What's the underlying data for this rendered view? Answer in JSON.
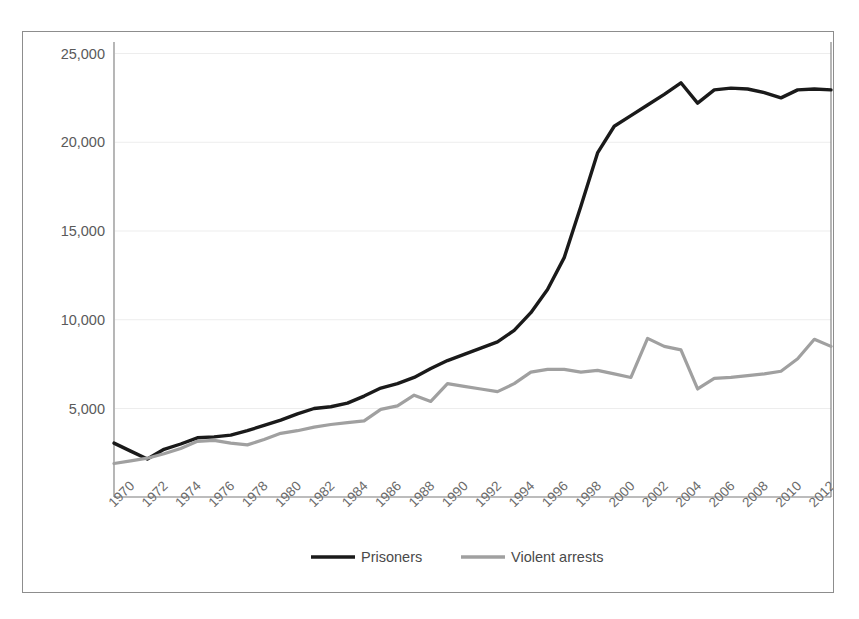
{
  "chart_data": {
    "type": "line",
    "title": "",
    "subtitle": "",
    "xlabel": "",
    "ylabel": "",
    "grid": true,
    "legend_position": "bottom",
    "xlim": [
      1970,
      2013
    ],
    "ylim": [
      0,
      25000
    ],
    "y_ticks": [
      5000,
      10000,
      15000,
      20000,
      25000
    ],
    "y_tick_labels": [
      "5,000",
      "10,000",
      "15,000",
      "20,000",
      "25,000"
    ],
    "x_tick_labels": [
      "1970",
      "1972",
      "1974",
      "1976",
      "1978",
      "1980",
      "1982",
      "1984",
      "1986",
      "1988",
      "1990",
      "1992",
      "1994",
      "1996",
      "1998",
      "2000",
      "2002",
      "2004",
      "2006",
      "2008",
      "2010",
      "2012"
    ],
    "x": [
      1970,
      1971,
      1972,
      1973,
      1974,
      1975,
      1976,
      1977,
      1978,
      1979,
      1980,
      1981,
      1982,
      1983,
      1984,
      1985,
      1986,
      1987,
      1988,
      1989,
      1990,
      1991,
      1992,
      1993,
      1994,
      1995,
      1996,
      1997,
      1998,
      1999,
      2000,
      2001,
      2002,
      2003,
      2004,
      2005,
      2006,
      2007,
      2008,
      2009,
      2010,
      2011,
      2012,
      2013
    ],
    "series": [
      {
        "name": "Prisoners",
        "color": "#1a1a1a",
        "values": [
          3050,
          2600,
          2150,
          2700,
          3000,
          3350,
          3400,
          3500,
          3750,
          4050,
          4350,
          4700,
          5000,
          5100,
          5300,
          5700,
          6150,
          6400,
          6750,
          7250,
          7700,
          8050,
          8400,
          8750,
          9400,
          10400,
          11700,
          13500,
          16400,
          19400,
          20900,
          21500,
          22100,
          22700,
          23350,
          22200,
          22950,
          23050,
          23000,
          22800,
          22500,
          22950,
          23000,
          22950
        ]
      },
      {
        "name": "Violent arrests",
        "color": "#a0a0a0",
        "values": [
          1900,
          2050,
          2200,
          2450,
          2750,
          3150,
          3200,
          3050,
          2950,
          3250,
          3600,
          3750,
          3950,
          4100,
          4200,
          4300,
          4950,
          5150,
          5750,
          5400,
          6400,
          6250,
          6100,
          5950,
          6400,
          7050,
          7200,
          7200,
          7050,
          7150,
          6950,
          6750,
          8950,
          8500,
          8300,
          6100,
          6700,
          6750,
          6850,
          6950,
          7100,
          7800,
          8900,
          8500
        ]
      }
    ]
  },
  "legend": {
    "entries": [
      {
        "label": "Prisoners",
        "color": "#1a1a1a"
      },
      {
        "label": "Violent arrests",
        "color": "#a0a0a0"
      }
    ]
  }
}
